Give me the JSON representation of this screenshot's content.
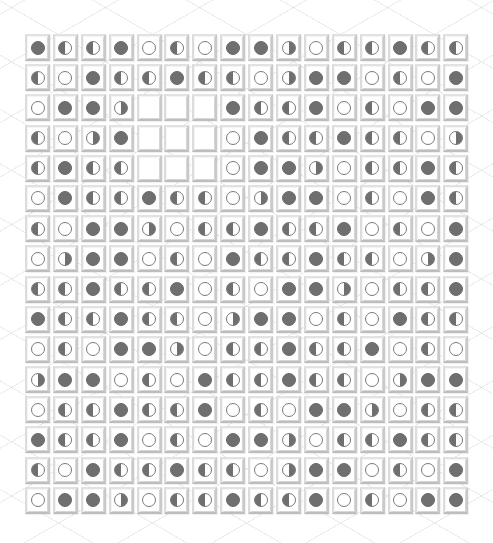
{
  "game": {
    "rows": 16,
    "cols": 16,
    "legend": {
      "F": "filled-circle",
      "E": "empty-circle",
      "L": "left-half-filled-circle",
      "R": "right-half-filled-circle",
      "B": "blank-tile"
    },
    "colors": {
      "disc_fill": "#6f6f6f",
      "tile_bg": "#ffffff",
      "tile_border": "#c9c9c9",
      "background": "#ffffff"
    },
    "grid": [
      [
        "F",
        "L",
        "L",
        "F",
        "E",
        "L",
        "E",
        "F",
        "F",
        "R",
        "E",
        "L",
        "L",
        "F",
        "L",
        "L"
      ],
      [
        "L",
        "E",
        "F",
        "L",
        "L",
        "F",
        "L",
        "L",
        "E",
        "R",
        "F",
        "F",
        "E",
        "L",
        "E",
        "F"
      ],
      [
        "E",
        "F",
        "F",
        "R",
        "B",
        "B",
        "B",
        "F",
        "L",
        "L",
        "F",
        "E",
        "L",
        "E",
        "F",
        "F"
      ],
      [
        "L",
        "E",
        "R",
        "F",
        "B",
        "B",
        "B",
        "E",
        "F",
        "L",
        "L",
        "F",
        "L",
        "L",
        "E",
        "R"
      ],
      [
        "L",
        "F",
        "L",
        "L",
        "B",
        "B",
        "B",
        "E",
        "F",
        "F",
        "R",
        "E",
        "L",
        "L",
        "F",
        "L"
      ],
      [
        "E",
        "F",
        "L",
        "L",
        "F",
        "L",
        "L",
        "E",
        "R",
        "F",
        "F",
        "E",
        "L",
        "E",
        "F",
        "L"
      ],
      [
        "L",
        "E",
        "F",
        "F",
        "R",
        "E",
        "L",
        "L",
        "F",
        "L",
        "L",
        "F",
        "E",
        "L",
        "E",
        "F"
      ],
      [
        "E",
        "R",
        "F",
        "F",
        "E",
        "L",
        "E",
        "F",
        "L",
        "L",
        "F",
        "L",
        "L",
        "E",
        "R",
        "F"
      ],
      [
        "L",
        "L",
        "F",
        "L",
        "L",
        "F",
        "E",
        "L",
        "E",
        "F",
        "F",
        "R",
        "E",
        "L",
        "L",
        "F"
      ],
      [
        "F",
        "L",
        "L",
        "F",
        "L",
        "L",
        "E",
        "R",
        "F",
        "F",
        "E",
        "L",
        "E",
        "F",
        "L",
        "L"
      ],
      [
        "E",
        "L",
        "E",
        "F",
        "F",
        "R",
        "E",
        "L",
        "L",
        "F",
        "L",
        "L",
        "F",
        "E",
        "L",
        "E"
      ],
      [
        "R",
        "F",
        "F",
        "E",
        "L",
        "E",
        "F",
        "L",
        "L",
        "F",
        "L",
        "L",
        "E",
        "R",
        "F",
        "F"
      ],
      [
        "E",
        "L",
        "L",
        "F",
        "L",
        "L",
        "F",
        "E",
        "L",
        "E",
        "F",
        "F",
        "R",
        "E",
        "L",
        "L"
      ],
      [
        "F",
        "L",
        "L",
        "F",
        "E",
        "L",
        "E",
        "F",
        "F",
        "R",
        "E",
        "L",
        "L",
        "F",
        "L",
        "L"
      ],
      [
        "L",
        "E",
        "F",
        "L",
        "L",
        "F",
        "L",
        "L",
        "E",
        "R",
        "F",
        "F",
        "E",
        "L",
        "E",
        "F"
      ],
      [
        "E",
        "F",
        "F",
        "R",
        "E",
        "L",
        "L",
        "F",
        "L",
        "L",
        "F",
        "E",
        "L",
        "E",
        "F",
        "F"
      ]
    ]
  }
}
